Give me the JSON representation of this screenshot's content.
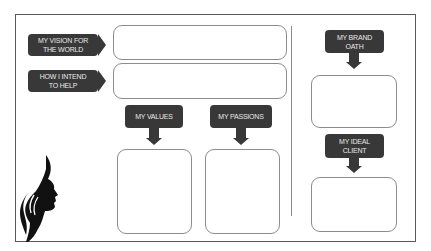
{
  "worksheet": {
    "labels": {
      "vision": [
        "MY VISION FOR",
        "THE WORLD"
      ],
      "intend": [
        "HOW I INTEND",
        "TO HELP"
      ],
      "values": "MY VALUES",
      "passions": "MY PASSIONS",
      "brand_oath": [
        "MY BRAND",
        "OATH"
      ],
      "ideal_client": [
        "MY IDEAL",
        "CLIENT"
      ]
    },
    "fields": {
      "vision": "",
      "intend": "",
      "values": "",
      "passions": "",
      "brand_oath": "",
      "ideal_client": ""
    },
    "colors": {
      "tag_fill": "#383838",
      "tag_text": "#e8e8e8",
      "box_border": "#8c8c8c",
      "frame_border": "#5a5a5a"
    },
    "decoration": "woman-profile-silhouette-icon"
  }
}
